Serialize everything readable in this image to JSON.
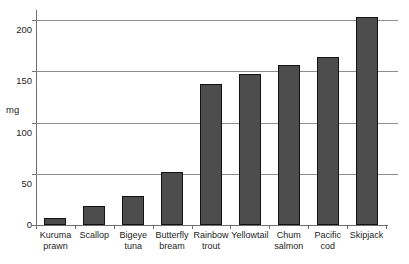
{
  "caption": {
    "cutoff_text_fragment": "cut-off text line"
  },
  "axis": {
    "y_title": "mg",
    "y_ticks": [
      "200",
      "150",
      "100",
      "50",
      "0"
    ]
  },
  "chart_data": {
    "type": "bar",
    "title": "",
    "xlabel": "",
    "ylabel": "mg",
    "ylim": [
      0,
      215
    ],
    "grid": true,
    "gridlines": [
      0,
      50,
      100,
      150,
      200
    ],
    "legend": "none",
    "categories": [
      "Kuruma prawn",
      "Scallop",
      "Bigeye tuna",
      "Butterfly bream",
      "Rainbow trout",
      "Yellowtail",
      "Chum salmon",
      "Pacific cod",
      "Skipjack"
    ],
    "category_lines": [
      [
        "Kuruma",
        "prawn"
      ],
      [
        "Scallop",
        ""
      ],
      [
        "Bigeye",
        "tuna"
      ],
      [
        "Butterfly",
        "bream"
      ],
      [
        "Rainbow",
        "trout"
      ],
      [
        "Yellowtail",
        ""
      ],
      [
        "Chum",
        "salmon"
      ],
      [
        "Pacific",
        "cod"
      ],
      [
        "Skipjack",
        ""
      ]
    ],
    "values": [
      7,
      19,
      29,
      53,
      141,
      151,
      160,
      168,
      208
    ],
    "bar_color": "#4d4d4d",
    "bar_edge_color": "#121212",
    "gridline_color": "#8d8d8d",
    "axis_color": "#6f6f6f"
  }
}
